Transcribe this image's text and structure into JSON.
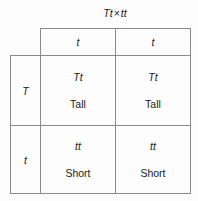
{
  "figure": {
    "kind": "punnett-square",
    "title_parent_1": "Tt",
    "title_operator": "×",
    "title_parent_2": "tt",
    "line_color": "#8a8a8a",
    "background_color": "#fdfdfd",
    "text_color": "#1a1a1a"
  },
  "column_headers": [
    {
      "label": "t"
    },
    {
      "label": "t"
    }
  ],
  "row_headers": [
    {
      "label": "T"
    },
    {
      "label": "t"
    }
  ],
  "cells": [
    {
      "genotype": "Tt",
      "phenotype": "Tall"
    },
    {
      "genotype": "Tt",
      "phenotype": "Tall"
    },
    {
      "genotype": "tt",
      "phenotype": "Short"
    },
    {
      "genotype": "tt",
      "phenotype": "Short"
    }
  ],
  "chart_data": {
    "type": "table",
    "xlabel": "",
    "ylabel": "",
    "columns": [
      "t",
      "t"
    ],
    "rows": [
      "T",
      "t"
    ],
    "values": [
      [
        "Tt (Tall)",
        "Tt (Tall)"
      ],
      [
        "tt (Short)",
        "tt (Short)"
      ]
    ],
    "genotype_ratio": "1 Tt : 1 tt",
    "phenotype_ratio": "2 Tall : 2 Short",
    "grid": true,
    "legend": "none"
  }
}
